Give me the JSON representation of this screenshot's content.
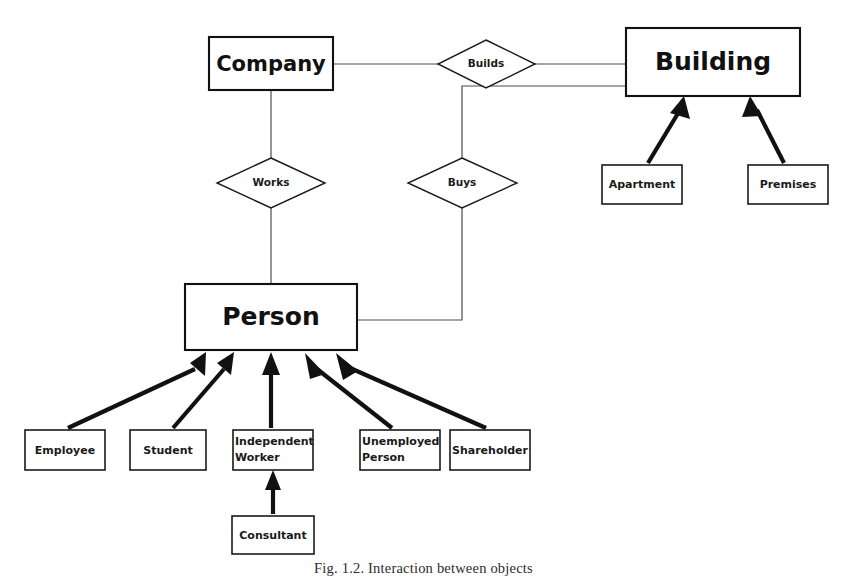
{
  "figure": {
    "caption": "Fig. 1.2. Interaction between objects"
  },
  "entities": {
    "company": {
      "label": "Company"
    },
    "building": {
      "label": "Building"
    },
    "person": {
      "label": "Person"
    },
    "apartment": {
      "label": "Apartment"
    },
    "premises": {
      "label": "Premises"
    },
    "employee": {
      "label": "Employee"
    },
    "student": {
      "label": "Student"
    },
    "independent_worker": {
      "label_line1": "Independent",
      "label_line2": "Worker"
    },
    "unemployed_person": {
      "label_line1": "Unemployed",
      "label_line2": "Person"
    },
    "shareholder": {
      "label": "Shareholder"
    },
    "consultant": {
      "label": "Consultant"
    }
  },
  "relationships": {
    "builds": {
      "label": "Builds"
    },
    "works": {
      "label": "Works"
    },
    "buys": {
      "label": "Buys"
    }
  },
  "colors": {
    "background": "#ffffff",
    "box_stroke": "#1a1a1a",
    "connector_stroke": "#4d4d4d",
    "arrow_fill": "#111111",
    "text": "#111111"
  }
}
